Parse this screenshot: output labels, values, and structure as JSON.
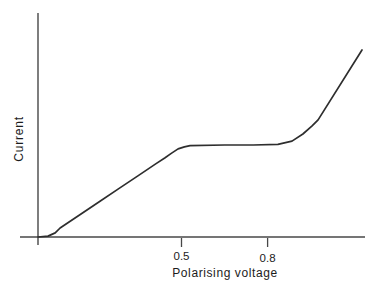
{
  "figure": {
    "background_color": "#ffffff",
    "curve_color": "#2e2e2e",
    "axis_color": "#474747",
    "text_color": "#1c1c1c"
  },
  "chart_data": {
    "type": "line",
    "title": "",
    "xlabel": "Polarising voltage",
    "ylabel": "Current",
    "x_ticks": [
      0.5,
      0.8
    ],
    "x_tick_labels": [
      "0.5",
      "0.8"
    ],
    "y_ticks": [],
    "xlim": [
      0,
      1.14
    ],
    "ylim": [
      0,
      1.05
    ],
    "grid": false,
    "legend_position": "none",
    "series": [
      {
        "name": "current-voltage-curve",
        "points_v_i": [
          [
            0.0,
            0.0
          ],
          [
            0.035,
            0.005
          ],
          [
            0.06,
            0.022
          ],
          [
            0.077,
            0.048
          ],
          [
            0.15,
            0.123
          ],
          [
            0.216,
            0.191
          ],
          [
            0.28,
            0.257
          ],
          [
            0.348,
            0.327
          ],
          [
            0.41,
            0.391
          ],
          [
            0.443,
            0.424
          ],
          [
            0.463,
            0.446
          ],
          [
            0.488,
            0.471
          ],
          [
            0.51,
            0.482
          ],
          [
            0.53,
            0.489
          ],
          [
            0.65,
            0.492
          ],
          [
            0.75,
            0.492
          ],
          [
            0.836,
            0.495
          ],
          [
            0.885,
            0.513
          ],
          [
            0.923,
            0.551
          ],
          [
            0.955,
            0.594
          ],
          [
            0.976,
            0.626
          ],
          [
            1.129,
            1.0
          ]
        ]
      }
    ],
    "layout_px": {
      "x_origin": 38,
      "y_axis_base": 237,
      "px_per_volt": 287,
      "px_per_current_unit": 187,
      "x_axis_start": 20,
      "x_axis_end": 365,
      "y_axis_top": 13,
      "y_axis_bottom": 245,
      "tick_length": 9,
      "axis_stroke_width": 1.4,
      "curve_stroke_width": 1.7
    }
  }
}
